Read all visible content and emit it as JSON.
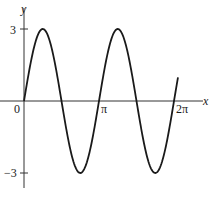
{
  "chart_data": {
    "type": "line",
    "title": "",
    "function": "y = 3 sin(2x)",
    "xlabel": "x",
    "ylabel": "y",
    "xlim": [
      0,
      6.45
    ],
    "ylim": [
      -3.6,
      3.8
    ],
    "x_ticks": [
      {
        "value": 0,
        "label": "0"
      },
      {
        "value": 3.14159,
        "label": "π"
      },
      {
        "value": 6.28318,
        "label": "2π"
      }
    ],
    "y_ticks": [
      {
        "value": 3,
        "label": "3"
      },
      {
        "value": -3,
        "label": "−3"
      }
    ],
    "series": [
      {
        "name": "3 sin 2x",
        "color": "#1a1a1a",
        "x": [
          0,
          0.785,
          1.571,
          2.356,
          3.142,
          3.927,
          4.712,
          5.498,
          6.283,
          6.45
        ],
        "y": [
          0,
          3,
          0,
          -3,
          0,
          3,
          0,
          -3,
          0,
          0.5
        ]
      }
    ],
    "grid": false,
    "legend": null
  },
  "axes": {
    "x_label": "x",
    "y_label": "y",
    "origin_label": "0",
    "pi_label": "π",
    "two_pi_label": "2π",
    "y_max_label": "3",
    "y_min_label": "−3"
  }
}
